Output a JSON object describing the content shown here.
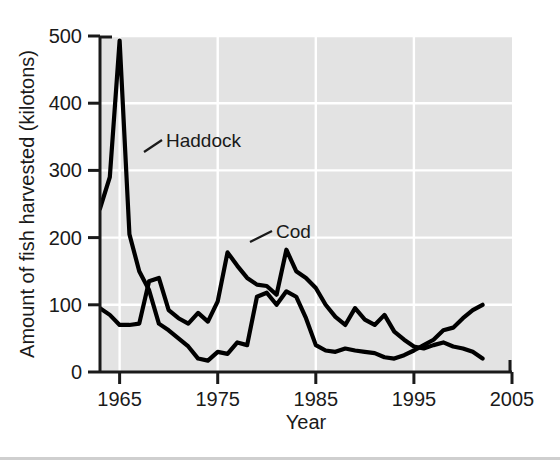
{
  "chart_data": {
    "type": "line",
    "title": "",
    "xlabel": "Year",
    "ylabel": "Amount of fish harvested (kilotons)",
    "xlim": [
      1963,
      2005
    ],
    "ylim": [
      0,
      500
    ],
    "xticks": [
      1965,
      1975,
      1985,
      1995,
      2005
    ],
    "xtick_labels": [
      "1965",
      "1975",
      "1985",
      "1995",
      "2005"
    ],
    "yticks": [
      0,
      100,
      200,
      300,
      400,
      500
    ],
    "ytick_labels": [
      "0",
      "100",
      "200",
      "300",
      "400",
      "500"
    ],
    "grid": true,
    "grid_color": "#ffffff",
    "plot_background": "#e3e3e3",
    "line_color": "#000000",
    "legend_position": "inline-annotation",
    "annotations": [
      {
        "label": "Haddock",
        "series": "Haddock",
        "points_to_year": 1966,
        "points_to_value": 360
      },
      {
        "label": "Cod",
        "series": "Cod",
        "points_to_year": 1977,
        "points_to_value": 182
      }
    ],
    "x": [
      1963,
      1964,
      1965,
      1966,
      1967,
      1968,
      1969,
      1970,
      1971,
      1972,
      1973,
      1974,
      1975,
      1976,
      1977,
      1978,
      1979,
      1980,
      1981,
      1982,
      1983,
      1984,
      1985,
      1986,
      1987,
      1988,
      1989,
      1990,
      1991,
      1992,
      1993,
      1994,
      1995,
      1996,
      1997,
      1998,
      1999,
      2000,
      2001,
      2002
    ],
    "series": [
      {
        "name": "Haddock",
        "values": [
          243,
          290,
          493,
          205,
          150,
          122,
          72,
          62,
          50,
          38,
          20,
          17,
          30,
          27,
          44,
          40,
          112,
          118,
          100,
          120,
          112,
          80,
          40,
          32,
          30,
          35,
          32,
          30,
          28,
          22,
          20,
          25,
          32,
          40,
          48,
          62,
          66,
          80,
          92,
          100
        ]
      },
      {
        "name": "Cod",
        "values": [
          95,
          85,
          70,
          70,
          72,
          135,
          140,
          92,
          80,
          72,
          88,
          75,
          105,
          178,
          158,
          140,
          130,
          128,
          115,
          182,
          150,
          140,
          125,
          100,
          82,
          70,
          95,
          78,
          70,
          85,
          60,
          48,
          38,
          35,
          40,
          44,
          38,
          35,
          30,
          20
        ]
      }
    ]
  }
}
